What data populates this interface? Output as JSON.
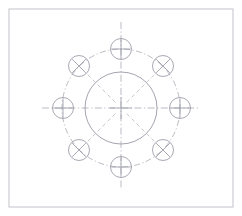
{
  "document": {
    "title": "Bolt Circle Hole Pattern",
    "drawing_type": "mechanical-engineering-cad-sketch",
    "background_color": "#ffffff",
    "canvas": {
      "width": 242,
      "height": 216
    }
  },
  "frame": {
    "label": "drawing-border",
    "x": 9,
    "y": 9,
    "width": 224,
    "height": 198,
    "stroke_color": "#c9c9cf",
    "stroke_width": 1.1,
    "fill": "#ffffff"
  },
  "geometry": {
    "center": {
      "x": 121,
      "y": 108
    },
    "center_mark": {
      "label": "center-crosshair",
      "arm_length": 11,
      "stroke_color": "#9a9aa6",
      "stroke_width": 0.8
    },
    "main_circle": {
      "label": "main-bore-circle",
      "radius": 36,
      "stroke_color": "#9a9aa6",
      "stroke_width": 0.9,
      "dash": "none",
      "fill": "none"
    },
    "bolt_circle": {
      "label": "bolt-pitch-circle",
      "radius": 59,
      "stroke_color": "#a6a6b0",
      "stroke_width": 0.75,
      "dash": "6 2.5 1.2 2.5",
      "fill": "none"
    },
    "centerlines": {
      "label": "axis-centerlines",
      "stroke_color": "#a6a6b0",
      "stroke_width": 0.75,
      "dash": "7 2.5 1.2 2.5",
      "horizontal_extent": {
        "x1": 42,
        "x2": 200
      },
      "vertical_extent": {
        "y1": 22,
        "y2": 190
      }
    },
    "radial_lines": {
      "label": "diagonal-radial-centerlines",
      "stroke_color": "#b0b0b9",
      "stroke_width": 0.7,
      "dash": "4 3",
      "inner_radius": 8,
      "outer_radius": 48,
      "angles_deg": [
        45,
        135,
        225,
        315
      ]
    }
  },
  "holes": [
    {
      "id": "hole-n",
      "label": "hole-north",
      "angle_deg": 270,
      "symbol": "plus",
      "cx": 121,
      "cy": 49,
      "r": 10.5
    },
    {
      "id": "hole-ne",
      "label": "hole-north-east",
      "angle_deg": 315,
      "symbol": "cross",
      "cx": 163,
      "cy": 66,
      "r": 10.5
    },
    {
      "id": "hole-e",
      "label": "hole-east",
      "angle_deg": 0,
      "symbol": "plus",
      "cx": 180,
      "cy": 108,
      "r": 10.5
    },
    {
      "id": "hole-se",
      "label": "hole-south-east",
      "angle_deg": 45,
      "symbol": "cross",
      "cx": 163,
      "cy": 150,
      "r": 10.5
    },
    {
      "id": "hole-s",
      "label": "hole-south",
      "angle_deg": 90,
      "symbol": "plus",
      "cx": 121,
      "cy": 167,
      "r": 10.5
    },
    {
      "id": "hole-sw",
      "label": "hole-south-west",
      "angle_deg": 135,
      "symbol": "cross",
      "cx": 79,
      "cy": 150,
      "r": 10.5
    },
    {
      "id": "hole-w",
      "label": "hole-west",
      "angle_deg": 180,
      "symbol": "plus",
      "cx": 63,
      "cy": 108,
      "r": 10.5
    },
    {
      "id": "hole-nw",
      "label": "hole-north-west",
      "angle_deg": 225,
      "symbol": "cross",
      "cx": 79,
      "cy": 66,
      "r": 10.5
    }
  ],
  "hole_style": {
    "stroke_color": "#9a9aa6",
    "stroke_width": 0.85,
    "symbol_stroke_width": 0.85,
    "fill": "none",
    "symbol_arm_ratio": 0.92
  },
  "counts": {
    "total_holes": 8,
    "plus_holes": 4,
    "cross_holes": 4
  }
}
